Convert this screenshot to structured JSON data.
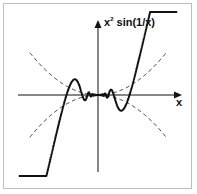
{
  "diagram": {
    "function_label_base": "x",
    "function_label_exp": "2",
    "function_label_rest": " sin(1/x)",
    "x_axis_label": "x",
    "envelopes": [
      "x^2",
      "-x^2"
    ],
    "colors": {
      "curve": "#111111",
      "envelope": "#333333",
      "frame": "#bdbdbd",
      "background": "#ffffff"
    }
  }
}
